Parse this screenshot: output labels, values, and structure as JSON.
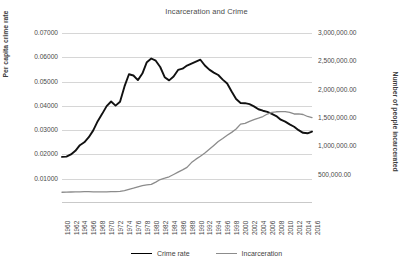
{
  "chart_data": {
    "type": "line",
    "title": "Incarceration and Crime",
    "xlabel": "",
    "ylabel": "Per capita crime rate",
    "y2label": "Number of people incarcerated",
    "grid": true,
    "legend_position": "bottom",
    "ylim": [
      0,
      0.07
    ],
    "y2lim": [
      0,
      3000000
    ],
    "yticks": [
      "0.01000",
      "0.02000",
      "0.03000",
      "0.04000",
      "0.05000",
      "0.06000",
      "0.07000"
    ],
    "ytick_values": [
      0.01,
      0.02,
      0.03,
      0.04,
      0.05,
      0.06,
      0.07
    ],
    "y2ticks": [
      "500,000.00",
      "1,000,000.00",
      "1,500,000.00",
      "2,000,000.00",
      "2,500,000.00",
      "3,000,000.00"
    ],
    "y2tick_values": [
      500000,
      1000000,
      1500000,
      2000000,
      2500000,
      3000000
    ],
    "x": [
      1960,
      1961,
      1962,
      1963,
      1964,
      1965,
      1966,
      1967,
      1968,
      1969,
      1970,
      1971,
      1972,
      1973,
      1974,
      1975,
      1976,
      1977,
      1978,
      1979,
      1980,
      1981,
      1982,
      1983,
      1984,
      1985,
      1986,
      1987,
      1988,
      1989,
      1990,
      1991,
      1992,
      1993,
      1994,
      1995,
      1996,
      1997,
      1998,
      1999,
      2000,
      2001,
      2002,
      2003,
      2004,
      2005,
      2006,
      2007,
      2008,
      2009,
      2010,
      2011,
      2012,
      2013,
      2014,
      2015,
      2016
    ],
    "xtick_labels": [
      "1960",
      "1962",
      "1964",
      "1966",
      "1968",
      "1970",
      "1972",
      "1974",
      "1976",
      "1978",
      "1980",
      "1982",
      "1984",
      "1986",
      "1988",
      "1990",
      "1992",
      "1994",
      "1996",
      "1998",
      "2000",
      "2002",
      "2004",
      "2006",
      "2008",
      "2010",
      "2012",
      "2014",
      "2016"
    ],
    "series": [
      {
        "name": "Crime rate",
        "axis": "left",
        "color": "#111111",
        "values": [
          0.019,
          0.0191,
          0.02,
          0.0215,
          0.0238,
          0.025,
          0.0271,
          0.0299,
          0.0337,
          0.0367,
          0.0399,
          0.0418,
          0.0401,
          0.0417,
          0.048,
          0.053,
          0.0525,
          0.0506,
          0.0533,
          0.058,
          0.0595,
          0.0586,
          0.056,
          0.0518,
          0.0505,
          0.0521,
          0.0548,
          0.0553,
          0.0566,
          0.0574,
          0.0582,
          0.059,
          0.0566,
          0.0549,
          0.0537,
          0.0527,
          0.0508,
          0.0492,
          0.0459,
          0.0428,
          0.0412,
          0.0411,
          0.0407,
          0.0398,
          0.0386,
          0.038,
          0.0375,
          0.0367,
          0.0358,
          0.0343,
          0.0335,
          0.0324,
          0.0314,
          0.03,
          0.0289,
          0.0287,
          0.0294
        ]
      },
      {
        "name": "Incarceration",
        "axis": "right",
        "color": "#8c8c8c",
        "values": [
          190000,
          192000,
          194000,
          196000,
          198000,
          200000,
          199000,
          198000,
          197000,
          197000,
          198000,
          200000,
          201000,
          204000,
          218000,
          241000,
          262000,
          285000,
          307000,
          320000,
          330000,
          369000,
          414000,
          437000,
          463000,
          503000,
          545000,
          585000,
          628000,
          713000,
          774000,
          826000,
          884000,
          949000,
          1016000,
          1085000,
          1138000,
          1195000,
          1246000,
          1305000,
          1391000,
          1405000,
          1440000,
          1470000,
          1497000,
          1526000,
          1570000,
          1598000,
          1610000,
          1613000,
          1613000,
          1599000,
          1571000,
          1574000,
          1562000,
          1527000,
          1506000
        ]
      }
    ]
  },
  "legend": [
    {
      "label": "Crime rate",
      "color": "#111111"
    },
    {
      "label": "Incarceration",
      "color": "#8c8c8c"
    }
  ]
}
